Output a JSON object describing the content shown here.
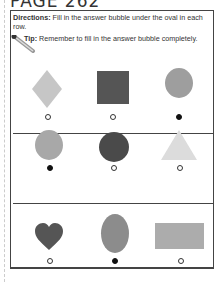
{
  "page": {
    "title": "PAGE 262"
  },
  "instructions": {
    "directions_label": "Directions:",
    "directions_text": " Fill in the answer bubble under the oval in each row.",
    "tip_label": "Tip:",
    "tip_text": " Remember to fill in the answer bubble completely.",
    "tip_icon": "pencil-icon"
  },
  "rows": [
    {
      "items": [
        {
          "shape": "diamond",
          "color": "#c6c6c6",
          "selected": false
        },
        {
          "shape": "square",
          "color": "#555555",
          "selected": false
        },
        {
          "shape": "oval",
          "color": "#9e9e9e",
          "selected": true
        }
      ]
    },
    {
      "items": [
        {
          "shape": "oval",
          "color": "#a8a8a8",
          "selected": true
        },
        {
          "shape": "circle",
          "color": "#4a4a4a",
          "selected": false
        },
        {
          "shape": "triangle",
          "color": "#dcdcdc",
          "selected": false
        }
      ]
    },
    {
      "items": [
        {
          "shape": "heart",
          "color": "#555555",
          "selected": false
        },
        {
          "shape": "oval",
          "color": "#8c8c8c",
          "selected": true
        },
        {
          "shape": "rectangle",
          "color": "#acacac",
          "selected": false
        }
      ]
    }
  ]
}
